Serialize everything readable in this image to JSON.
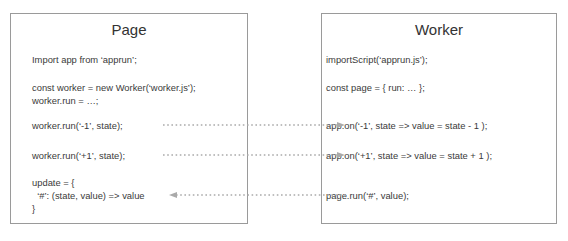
{
  "page": {
    "title": "Page",
    "lines": {
      "import": "Import app from ‘apprun’;",
      "const_worker": "const worker = new Worker(‘worker.js’);",
      "worker_run_assign": "worker.run = …;",
      "run_minus": "worker.run(‘-1’, state);",
      "run_plus": "worker.run(‘+1’, state);",
      "update_open": "update = {",
      "update_handler": "  ‘#’: (state, value) => value",
      "update_close": "}"
    }
  },
  "worker": {
    "title": "Worker",
    "lines": {
      "import_script": "importScript(‘apprun.js’);",
      "const_page": "const page = { run: … };",
      "on_minus": "app.on(‘-1’, state => value = state - 1 );",
      "on_plus": "app.on(‘+1’, state => value = state + 1 );",
      "page_run": "page.run(‘#’, value);"
    }
  },
  "arrows": [
    {
      "name": "arrow-run-minus",
      "from": "page.run_minus",
      "to": "worker.on_minus",
      "direction": "right"
    },
    {
      "name": "arrow-run-plus",
      "from": "page.run_plus",
      "to": "worker.on_plus",
      "direction": "right"
    },
    {
      "name": "arrow-page-run",
      "from": "worker.page_run",
      "to": "page.update_handler",
      "direction": "left"
    }
  ],
  "colors": {
    "border": "#9a9a9a",
    "text": "#333333",
    "arrow": "#aaaaaa"
  }
}
